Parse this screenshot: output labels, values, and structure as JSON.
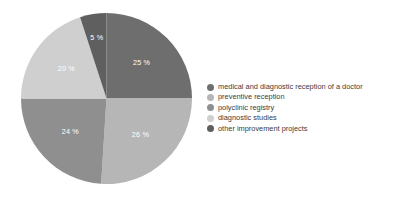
{
  "chart_data": {
    "type": "pie",
    "title": "",
    "legend_position": "right",
    "categories": [
      "medical and diagnostic reception of a doctor",
      "preventive reception",
      "polyclinic registry",
      "diagnostic studies",
      "other improvement projects"
    ],
    "values": [
      25,
      26,
      24,
      20,
      5
    ],
    "data_labels": [
      "25 %",
      "26 %",
      "24 %",
      "20 %",
      "5 %"
    ],
    "colors": [
      "#6e6e6e",
      "#b6b6b6",
      "#8f8f8f",
      "#cfcfcf",
      "#5f5f5f"
    ],
    "label_color": "#ffffff",
    "grid": false,
    "xlabel": "",
    "ylabel": ""
  },
  "legend": {
    "items": [
      {
        "label": "medical and diagnostic reception of a doctor",
        "color": "#6e6e6e"
      },
      {
        "label": "preventive reception",
        "color": "#b6b6b6"
      },
      {
        "label": "polyclinic registry",
        "color": "#8f8f8f"
      },
      {
        "label": "diagnostic studies",
        "color": "#cfcfcf"
      },
      {
        "label": "other improvement projects",
        "color": "#5f5f5f"
      }
    ]
  },
  "slice_labels": {
    "s0": "25 %",
    "s1": "26 %",
    "s2": "24 %",
    "s3": "20 %",
    "s4": "5 %"
  },
  "background": "#ffffff"
}
